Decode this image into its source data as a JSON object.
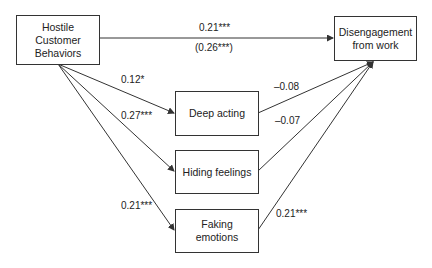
{
  "nodes": {
    "hostile": "Hostile\nCustomer\nBehaviors",
    "disengagement": "Disengagement\nfrom work",
    "deep_acting": "Deep acting",
    "hiding_feelings": "Hiding feelings",
    "faking_emotions": "Faking\nemotions"
  },
  "paths": {
    "hostile_to_disengagement": "0.21***",
    "hostile_to_disengagement_total": "(0.26***)",
    "hostile_to_deep_acting": "0.12*",
    "hostile_to_hiding_feelings": "0.27***",
    "hostile_to_faking_emotions": "0.21***",
    "deep_acting_to_disengagement": "–0.08",
    "hiding_feelings_to_disengagement": "–0.07",
    "faking_emotions_to_disengagement": "0.21***"
  },
  "colors": {
    "line": "#333333",
    "text": "#222222",
    "background": "#ffffff"
  }
}
